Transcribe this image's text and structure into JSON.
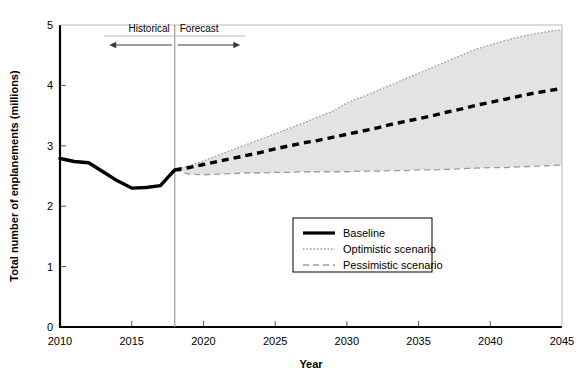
{
  "chart_data": {
    "type": "line",
    "title": "",
    "xlabel": "Year",
    "ylabel": "Total number of enplanements (millions)",
    "xlim": [
      2010,
      2045
    ],
    "ylim": [
      0,
      5
    ],
    "xticks": [
      2010,
      2015,
      2020,
      2025,
      2030,
      2035,
      2040,
      2045
    ],
    "xticklabels": [
      "2010",
      "2015",
      "2020",
      "2025",
      "2030",
      "2035",
      "2040",
      "2045"
    ],
    "yticks": [
      0,
      1,
      2,
      3,
      4,
      5
    ],
    "yticklabels": [
      "0",
      "1",
      "2",
      "3",
      "4",
      "5"
    ],
    "grid": false,
    "legend_position": "center-lower",
    "split_year": 2018,
    "annotations": [
      {
        "label": "Historical",
        "direction": "left",
        "year_start": 2018,
        "year_end": 2013.5
      },
      {
        "label": "Forecast",
        "direction": "right",
        "year_start": 2018,
        "year_end": 2022.5
      }
    ],
    "series": [
      {
        "name": "Baseline",
        "style": "solid-then-dashed",
        "color": "#000000",
        "x": [
          2010,
          2011,
          2012,
          2013,
          2014,
          2015,
          2016,
          2017,
          2018,
          2019,
          2020,
          2021,
          2022,
          2023,
          2024,
          2025,
          2026,
          2027,
          2028,
          2029,
          2030,
          2031,
          2032,
          2033,
          2034,
          2035,
          2036,
          2037,
          2038,
          2039,
          2040,
          2041,
          2042,
          2043,
          2044,
          2045
        ],
        "values": [
          2.79,
          2.74,
          2.72,
          2.57,
          2.42,
          2.3,
          2.31,
          2.34,
          2.6,
          2.64,
          2.69,
          2.74,
          2.79,
          2.84,
          2.89,
          2.95,
          3.0,
          3.05,
          3.09,
          3.14,
          3.19,
          3.24,
          3.29,
          3.35,
          3.4,
          3.45,
          3.5,
          3.56,
          3.61,
          3.67,
          3.72,
          3.77,
          3.82,
          3.87,
          3.91,
          3.95
        ]
      },
      {
        "name": "Optimistic scenario",
        "style": "dotted",
        "color": "#9d9d9d",
        "x": [
          2018,
          2019,
          2020,
          2021,
          2022,
          2023,
          2024,
          2025,
          2026,
          2027,
          2028,
          2029,
          2030,
          2031,
          2032,
          2033,
          2034,
          2035,
          2036,
          2037,
          2038,
          2039,
          2040,
          2041,
          2042,
          2043,
          2044,
          2045
        ],
        "values": [
          2.6,
          2.67,
          2.75,
          2.84,
          2.93,
          3.02,
          3.11,
          3.2,
          3.29,
          3.38,
          3.48,
          3.57,
          3.71,
          3.8,
          3.9,
          4.0,
          4.1,
          4.2,
          4.3,
          4.4,
          4.5,
          4.6,
          4.67,
          4.74,
          4.8,
          4.85,
          4.89,
          4.92
        ]
      },
      {
        "name": "Pessimistic scenario",
        "style": "dashed",
        "color": "#9d9d9d",
        "x": [
          2018,
          2019,
          2020,
          2021,
          2022,
          2023,
          2024,
          2025,
          2026,
          2027,
          2028,
          2029,
          2030,
          2031,
          2032,
          2033,
          2034,
          2035,
          2036,
          2037,
          2038,
          2039,
          2040,
          2041,
          2042,
          2043,
          2044,
          2045
        ],
        "values": [
          2.6,
          2.53,
          2.52,
          2.53,
          2.54,
          2.55,
          2.55,
          2.56,
          2.56,
          2.57,
          2.57,
          2.57,
          2.57,
          2.58,
          2.58,
          2.59,
          2.59,
          2.6,
          2.6,
          2.61,
          2.62,
          2.63,
          2.64,
          2.64,
          2.65,
          2.66,
          2.67,
          2.68
        ]
      }
    ],
    "band": {
      "name": "scenario-range",
      "upper_series": "Optimistic scenario",
      "lower_series": "Pessimistic scenario",
      "color": "#e3e3e3"
    },
    "legend": [
      {
        "label": "Baseline",
        "style": "solid",
        "color": "#000000"
      },
      {
        "label": "Optimistic scenario",
        "style": "dotted",
        "color": "#9d9d9d"
      },
      {
        "label": "Pessimistic scenario",
        "style": "dashed",
        "color": "#9d9d9d"
      }
    ]
  }
}
